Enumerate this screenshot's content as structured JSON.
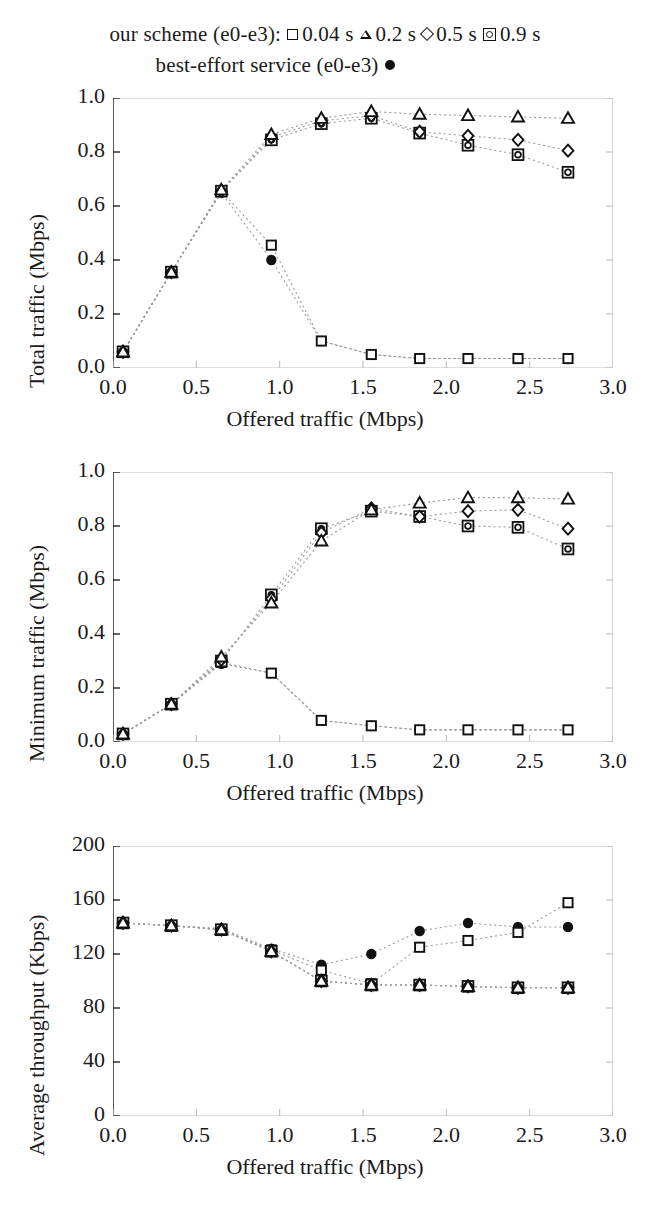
{
  "legend": {
    "line1_prefix": "our scheme (e0-e3):",
    "entries": [
      {
        "label": "0.04 s",
        "marker": "open-square"
      },
      {
        "label": "0.2 s",
        "marker": "open-triangle"
      },
      {
        "label": "0.5 s",
        "marker": "open-diamond"
      },
      {
        "label": "0.9 s",
        "marker": "square-circle"
      }
    ],
    "line2_prefix": "best-effort service (e0-e3)",
    "line2_marker": "filled-circle"
  },
  "colors": {
    "ink": "#111111",
    "axis": "#111111",
    "grid": "#bdbdbd",
    "connector": "#9a9a9a",
    "background": "#ffffff"
  },
  "chart_data": [
    {
      "id": "total-traffic",
      "type": "scatter",
      "title": "",
      "xlabel": "Offered traffic (Mbps)",
      "ylabel": "Total traffic (Mbps)",
      "xlim": [
        0.0,
        3.0
      ],
      "ylim": [
        0.0,
        1.0
      ],
      "xticks": [
        "0.0",
        "0.5",
        "1.0",
        "1.5",
        "2.0",
        "2.5",
        "3.0"
      ],
      "xtick_values": [
        0.0,
        0.5,
        1.0,
        1.5,
        2.0,
        2.5,
        3.0
      ],
      "yticks": [
        "0.0",
        "0.2",
        "0.4",
        "0.6",
        "0.8",
        "1.0"
      ],
      "ytick_values": [
        0.0,
        0.2,
        0.4,
        0.6,
        0.8,
        1.0
      ],
      "grid": false,
      "legend_position": "above-figure",
      "x": [
        0.06,
        0.35,
        0.65,
        0.95,
        1.25,
        1.55,
        1.84,
        2.13,
        2.43,
        2.73
      ],
      "series": [
        {
          "name": "0.04 s",
          "marker": "open-square",
          "values": [
            0.06,
            0.355,
            0.655,
            0.455,
            0.1,
            0.05,
            0.035,
            0.035,
            0.035,
            0.035
          ]
        },
        {
          "name": "0.2 s",
          "marker": "open-triangle",
          "values": [
            0.06,
            0.355,
            0.66,
            0.865,
            0.925,
            0.95,
            0.94,
            0.935,
            0.93,
            0.925
          ]
        },
        {
          "name": "0.5 s",
          "marker": "open-diamond",
          "values": [
            0.06,
            0.355,
            0.655,
            0.855,
            0.915,
            0.935,
            0.875,
            0.86,
            0.845,
            0.805
          ]
        },
        {
          "name": "0.9 s",
          "marker": "square-circle",
          "values": [
            0.06,
            0.355,
            0.655,
            0.845,
            0.905,
            0.925,
            0.87,
            0.825,
            0.79,
            0.725
          ]
        },
        {
          "name": "best-effort",
          "marker": "filled-circle",
          "values": [
            0.06,
            0.355,
            0.65,
            0.4,
            0.1,
            0.05,
            0.035,
            0.035,
            0.035,
            0.035
          ]
        }
      ]
    },
    {
      "id": "minimum-traffic",
      "type": "scatter",
      "title": "",
      "xlabel": "Offered traffic (Mbps)",
      "ylabel": "Minimum traffic (Mbps)",
      "xlim": [
        0.0,
        3.0
      ],
      "ylim": [
        0.0,
        1.0
      ],
      "xticks": [
        "0.0",
        "0.5",
        "1.0",
        "1.5",
        "2.0",
        "2.5",
        "3.0"
      ],
      "xtick_values": [
        0.0,
        0.5,
        1.0,
        1.5,
        2.0,
        2.5,
        3.0
      ],
      "yticks": [
        "0.0",
        "0.2",
        "0.4",
        "0.6",
        "0.8",
        "1.0"
      ],
      "ytick_values": [
        0.0,
        0.2,
        0.4,
        0.6,
        0.8,
        1.0
      ],
      "grid": false,
      "legend_position": "above-figure",
      "x": [
        0.06,
        0.35,
        0.65,
        0.95,
        1.25,
        1.55,
        1.84,
        2.13,
        2.43,
        2.73
      ],
      "series": [
        {
          "name": "0.04 s",
          "marker": "open-square",
          "values": [
            0.03,
            0.14,
            0.295,
            0.255,
            0.08,
            0.06,
            0.045,
            0.045,
            0.045,
            0.045
          ]
        },
        {
          "name": "0.2 s",
          "marker": "open-triangle",
          "values": [
            0.03,
            0.14,
            0.315,
            0.515,
            0.745,
            0.86,
            0.885,
            0.905,
            0.905,
            0.9
          ]
        },
        {
          "name": "0.5 s",
          "marker": "open-diamond",
          "values": [
            0.03,
            0.14,
            0.305,
            0.53,
            0.775,
            0.865,
            0.835,
            0.855,
            0.86,
            0.79
          ]
        },
        {
          "name": "0.9 s",
          "marker": "square-circle",
          "values": [
            0.03,
            0.14,
            0.3,
            0.545,
            0.79,
            0.855,
            0.835,
            0.8,
            0.795,
            0.715
          ]
        },
        {
          "name": "best-effort",
          "marker": "filled-circle",
          "values": [
            0.03,
            0.14,
            0.29,
            0.255,
            0.08,
            0.06,
            0.045,
            0.045,
            0.045,
            0.045
          ]
        }
      ]
    },
    {
      "id": "average-throughput",
      "type": "scatter",
      "title": "",
      "xlabel": "Offered traffic (Mbps)",
      "ylabel": "Average throughput (Kbps)",
      "xlim": [
        0.0,
        3.0
      ],
      "ylim": [
        0,
        200
      ],
      "xticks": [
        "0.0",
        "0.5",
        "1.0",
        "1.5",
        "2.0",
        "2.5",
        "3.0"
      ],
      "xtick_values": [
        0.0,
        0.5,
        1.0,
        1.5,
        2.0,
        2.5,
        3.0
      ],
      "yticks": [
        "0",
        "40",
        "80",
        "120",
        "160",
        "200"
      ],
      "ytick_values": [
        0,
        40,
        80,
        120,
        160,
        200
      ],
      "grid": false,
      "legend_position": "above-figure",
      "x": [
        0.06,
        0.35,
        0.65,
        0.95,
        1.25,
        1.55,
        1.84,
        2.13,
        2.43,
        2.73
      ],
      "series": [
        {
          "name": "0.04 s",
          "marker": "open-square",
          "values": [
            143,
            141,
            138,
            123,
            108,
            98,
            125,
            130,
            136,
            158
          ]
        },
        {
          "name": "0.2 s",
          "marker": "open-triangle",
          "values": [
            143,
            141,
            138,
            122,
            100,
            97,
            97,
            96,
            95,
            95
          ]
        },
        {
          "name": "0.5 s",
          "marker": "open-diamond",
          "values": [
            143,
            141,
            138,
            122,
            100,
            97,
            97,
            96,
            95,
            95
          ]
        },
        {
          "name": "0.9 s",
          "marker": "square-circle",
          "values": [
            143,
            141,
            138,
            122,
            100,
            97,
            97,
            96,
            95,
            95
          ]
        },
        {
          "name": "best-effort",
          "marker": "filled-circle",
          "values": [
            143,
            141,
            139,
            124,
            112,
            120,
            137,
            143,
            140,
            140
          ]
        }
      ]
    }
  ]
}
